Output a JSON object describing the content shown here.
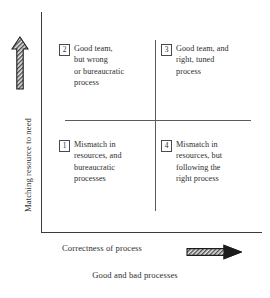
{
  "figure": {
    "caption": "Good and bad processes",
    "axes": {
      "y_label": "Matching resource to need",
      "x_label": "Correctness of process",
      "y_arrow_icon": "arrow-up-hatched",
      "x_arrow_icon": "arrow-right-hatched"
    },
    "quadrants": [
      {
        "number": "1",
        "position": "bottom-left",
        "text": "Mismatch in\nresources, and\nbureaucratic\nprocesses"
      },
      {
        "number": "2",
        "position": "top-left",
        "text": "Good team,\nbut wrong\nor bureaucratic\nprocess"
      },
      {
        "number": "3",
        "position": "top-right",
        "text": "Good team, and\nright, tuned\nprocess"
      },
      {
        "number": "4",
        "position": "bottom-right",
        "text": "Mismatch in\nresources, but\nfollowing the\nright process"
      }
    ],
    "colors": {
      "background": "#ffffff",
      "text": "#2e2e2e",
      "axis_line": "#3b3b3b",
      "divider_line": "#5a5a5a",
      "arrow_outline": "#1c1c1c",
      "arrow_fill": "#d8d8d8"
    }
  }
}
